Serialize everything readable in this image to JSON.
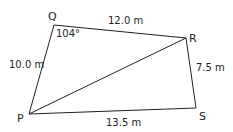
{
  "diagram": {
    "type": "quadrilateral",
    "stroke_color": "#231f20",
    "vertices": {
      "P": {
        "label": "P",
        "x": 29,
        "y": 114
      },
      "Q": {
        "label": "Q",
        "x": 54,
        "y": 25
      },
      "R": {
        "label": "R",
        "x": 186,
        "y": 38
      },
      "S": {
        "label": "S",
        "x": 196,
        "y": 108
      }
    },
    "sides": {
      "PQ": "10.0 m",
      "QR": "12.0 m",
      "RS": "7.5 m",
      "PS": "13.5 m"
    },
    "diagonal": "PR",
    "angles": {
      "Q": "104°"
    }
  }
}
